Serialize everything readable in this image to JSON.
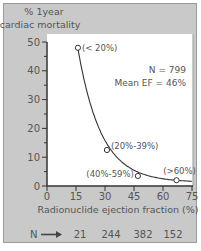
{
  "chart_data": {
    "type": "line",
    "title": "",
    "ylabel": "% 1year cardiac mortality",
    "ylabel_lines": [
      "% 1year",
      "cardiac mortality"
    ],
    "xlabel": "Radionuclide ejection fraction (%)",
    "xlim": [
      0,
      75
    ],
    "ylim": [
      0,
      50
    ],
    "x_ticks": [
      0,
      15,
      30,
      45,
      60,
      75
    ],
    "y_ticks": [
      0,
      10,
      20,
      30,
      40,
      50
    ],
    "grid": false,
    "series": [
      {
        "name": "1-year cardiac mortality",
        "points": [
          {
            "x": 16,
            "y": 48,
            "label": "(< 20%)"
          },
          {
            "x": 31,
            "y": 12.5,
            "label": "(20%-39%)"
          },
          {
            "x": 47,
            "y": 3.5,
            "label": "(40%-59%)"
          },
          {
            "x": 67,
            "y": 2,
            "label": "(>60%)"
          }
        ]
      }
    ],
    "annotations": [
      "N = 799",
      "Mean EF = 46%"
    ],
    "n_row": {
      "label": "N",
      "arrow": "→",
      "values": [
        21,
        244,
        382,
        152
      ]
    }
  },
  "colors": {
    "background": "#c9c9c9",
    "plot_area": "#ffffff",
    "line": "#333333",
    "text": "#555555"
  }
}
